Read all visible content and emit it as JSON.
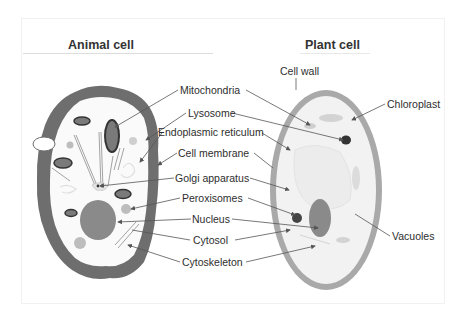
{
  "panels": {
    "left": {
      "title": "Animal cell"
    },
    "right": {
      "title": "Plant cell"
    }
  },
  "labels": {
    "cell_wall": "Cell wall",
    "chloroplast": "Chloroplast",
    "mitochondria": "Mitochondria",
    "lysosome": "Lysosome",
    "endoplasmic_reticulum": "Endoplasmic reticulum",
    "cell_membrane": "Cell membrane",
    "golgi_apparatus": "Golgi apparatus",
    "peroxisomes": "Peroxisomes",
    "nucleus": "Nucleus",
    "cytosol": "Cytosol",
    "cytoskeleton": "Cytoskeleton",
    "vacuoles": "Vacuoles"
  },
  "colors": {
    "animal_membrane": "#6e6e6e",
    "animal_cytoplasm": "#fafafa",
    "nucleus": "#8a8a8a",
    "plant_wall": "#a9a9a9",
    "plant_cytoplasm": "#f2f2f2",
    "leader_line": "#555555"
  }
}
